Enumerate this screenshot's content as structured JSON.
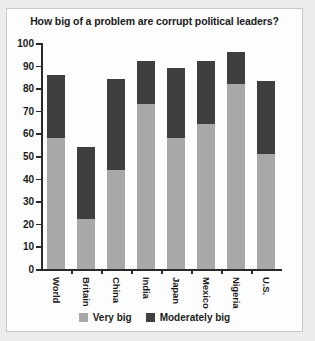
{
  "chart_data": {
    "type": "bar",
    "subtype": "stacked-bar",
    "title": "How big of a problem are corrupt political leaders?",
    "xlabel": "",
    "ylabel": "",
    "ylim": [
      0,
      100
    ],
    "yticks": [
      0,
      10,
      20,
      30,
      40,
      50,
      60,
      70,
      80,
      90,
      100
    ],
    "ytick_labels": [
      "0",
      "10",
      "20",
      "30",
      "40",
      "50",
      "60",
      "70",
      "80",
      "90",
      "100"
    ],
    "grid": false,
    "legend_position": "bottom",
    "categories": [
      "World",
      "Britain",
      "China",
      "India",
      "Japan",
      "Mexico",
      "Nigeria",
      "U.S."
    ],
    "series": [
      {
        "name": "Very big",
        "color": "#a8a8a8",
        "values": [
          58,
          22,
          44,
          73,
          58,
          64,
          82,
          51
        ]
      },
      {
        "name": "Moderately big",
        "color": "#3f3f3f",
        "values": [
          28,
          32,
          40,
          19,
          31,
          28,
          14,
          32
        ]
      }
    ],
    "totals": [
      86,
      54,
      84,
      92,
      89,
      92,
      96,
      83
    ]
  },
  "legend": {
    "items": [
      {
        "label": "Very big",
        "color": "#a8a8a8"
      },
      {
        "label": "Moderately big",
        "color": "#3f3f3f"
      }
    ]
  },
  "colors": {
    "panel_background": "#fdfdfd",
    "page_background": "#ececec",
    "axis": "#2a2a2a",
    "text": "#1b1b1b",
    "series_very_big": "#a8a8a8",
    "series_moderately_big": "#3f3f3f"
  }
}
